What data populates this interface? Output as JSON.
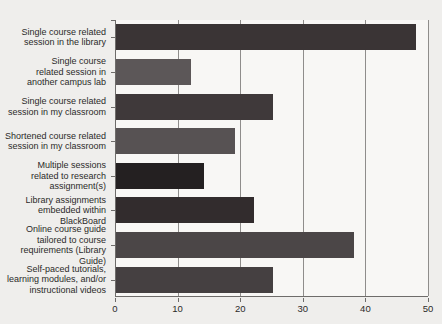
{
  "chart_data": {
    "type": "bar",
    "orientation": "horizontal",
    "title": "",
    "xlabel": "",
    "ylabel": "",
    "categories": [
      "Single course related session in the library",
      "Single course related session in another campus lab",
      "Single course related session in my classroom",
      "Shortened course related session in my classroom",
      "Multiple sessions related to research assignment(s)",
      "Library assignments embedded within BlackBoard",
      "Online course guide tailored to course requirements (Library Guide)",
      "Self-paced tutorials, learning modules, and/or instructional videos"
    ],
    "label_lines": [
      [
        "Single course related",
        "session in the library"
      ],
      [
        "Single course",
        "related session in",
        "another campus lab"
      ],
      [
        "Single course related",
        "session in my classroom"
      ],
      [
        "Shortened course related",
        "session in my classroom"
      ],
      [
        "Multiple sessions",
        "related to research",
        "assignment(s)"
      ],
      [
        "Library assignments",
        "embedded within BlackBoard"
      ],
      [
        "Online course guide",
        "tailored to course",
        "requirements (Library Guide)"
      ],
      [
        "Self-paced tutorials,",
        "learning modules, and/or",
        "instructional videos"
      ]
    ],
    "values": [
      48,
      12,
      25,
      19,
      14,
      22,
      38,
      25
    ],
    "bar_colors": [
      "#3a3435",
      "#5c5758",
      "#3f393a",
      "#575253",
      "#242021",
      "#322c2d",
      "#4b4647",
      "#454041"
    ],
    "xlim": [
      0,
      50
    ],
    "x_ticks": [
      0,
      10,
      20,
      30,
      40,
      50
    ],
    "grid": true,
    "legend": false
  },
  "colors": {
    "figure_background": "#efeeec",
    "plot_background": "#f8f7f5",
    "axis_line": "#6e6c6a",
    "gridline": "#8f8d8b",
    "text": "#2b2a29"
  }
}
